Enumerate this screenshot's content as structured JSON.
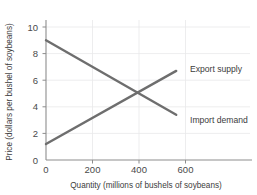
{
  "chart_data": {
    "type": "line",
    "title": "",
    "xlabel": "Quantity (millions of bushels of soybeans)",
    "ylabel": "Price (dollars per bushel of soybeans)",
    "xlim": [
      0,
      760
    ],
    "ylim": [
      0,
      11.2
    ],
    "xticks": [
      0,
      200,
      400,
      600
    ],
    "yticks": [
      0,
      2,
      4,
      6,
      8,
      10
    ],
    "xtick_labels": [
      "0",
      "200",
      "400",
      "600"
    ],
    "ytick_labels": [
      "0",
      "2",
      "4",
      "6",
      "8",
      "10"
    ],
    "grid": true,
    "legend_position": "inline-right",
    "line_color": "#6e6e6e",
    "series": [
      {
        "name": "Import demand",
        "label": "Import demand",
        "color": "#6e6e6e",
        "x": [
          0,
          560
        ],
        "values": [
          9.0,
          3.4
        ]
      },
      {
        "name": "Export supply",
        "label": "Export supply",
        "color": "#6e6e6e",
        "x": [
          0,
          560
        ],
        "values": [
          1.2,
          6.7
        ]
      }
    ],
    "annotations": [
      {
        "name": "equilibrium",
        "x": 400,
        "y": 5.0,
        "text": ""
      }
    ]
  },
  "labels": {
    "export_supply": "Export supply",
    "import_demand": "Import demand"
  },
  "axes": {
    "x_title": "Quantity (millions of bushels of soybeans)",
    "y_title": "Price (dollars per bushel of soybeans)",
    "x_tick_0": "0",
    "x_tick_1": "200",
    "x_tick_2": "400",
    "x_tick_3": "600",
    "y_tick_0": "0",
    "y_tick_1": "2",
    "y_tick_2": "4",
    "y_tick_3": "6",
    "y_tick_4": "8",
    "y_tick_5": "10"
  }
}
